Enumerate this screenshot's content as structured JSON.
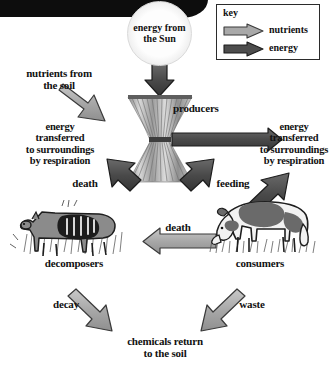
{
  "diagram": {
    "background": "#ffffff"
  },
  "colors": {
    "nutrients_fill": "#a9a9a9",
    "nutrients_stroke": "#3a3a3a",
    "energy_fill": "#4d4d4d",
    "energy_stroke": "#1e1e1e",
    "text": "#111111",
    "sun_fill": "#f4f4f4",
    "grass_green": "#6f6f6f",
    "key_border": "#2b2b2b"
  },
  "key": {
    "title": "key",
    "entries": [
      {
        "label": "nutrients",
        "type": "nutrients",
        "icon": "light-gray-arrow-icon"
      },
      {
        "label": "energy",
        "type": "energy",
        "icon": "dark-gray-arrow-icon"
      }
    ]
  },
  "nodes": {
    "sun": {
      "label": "energy\nfrom the\nSun",
      "icon": "sun-icon"
    },
    "producers": {
      "label": "producers",
      "icon": "grass-icon"
    },
    "consumers": {
      "label": "consumers",
      "icon": "cow-icon"
    },
    "decomposers": {
      "label": "decomposers",
      "icon": "carcass-icon"
    },
    "soil_input": {
      "label": "nutrients from\nthe soil"
    },
    "respiration_left": {
      "label": "energy\ntransferred\nto surroundings\nby respiration"
    },
    "respiration_right": {
      "label": "energy\ntransferred\nto surroundings\nby respiration"
    },
    "chemicals": {
      "label": "chemicals return\nto the soil"
    }
  },
  "flows": [
    {
      "name": "sun-to-producers",
      "label": "",
      "type": "energy"
    },
    {
      "name": "soil-to-producers",
      "label": "nutrients from the soil",
      "type": "nutrients"
    },
    {
      "name": "producers-respiration-left",
      "label": "energy transferred to surroundings by respiration",
      "type": "energy"
    },
    {
      "name": "producers-respiration-right",
      "label": "energy transferred to surroundings by respiration",
      "type": "energy"
    },
    {
      "name": "producers-to-decomposers",
      "label": "death",
      "type": "energy"
    },
    {
      "name": "producers-to-consumers",
      "label": "feeding",
      "type": "energy"
    },
    {
      "name": "consumers-to-decomposers",
      "label": "death",
      "type": "nutrients"
    },
    {
      "name": "consumers-respiration",
      "label": "energy transferred to surroundings by respiration",
      "type": "energy"
    },
    {
      "name": "decomposers-to-soil",
      "label": "decay",
      "type": "nutrients"
    },
    {
      "name": "consumers-to-soil",
      "label": "waste",
      "type": "nutrients"
    }
  ],
  "labels": {
    "death_left": "death",
    "feeding": "feeding",
    "death_mid": "death",
    "decay": "decay",
    "waste": "waste"
  }
}
